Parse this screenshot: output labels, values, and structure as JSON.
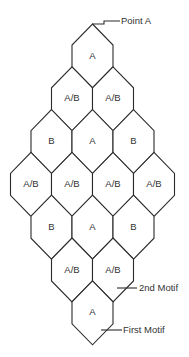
{
  "diagram": {
    "type": "hexagonal-motif-layout",
    "rows": [
      {
        "row": 1,
        "cells": [
          "A"
        ]
      },
      {
        "row": 2,
        "cells": [
          "A/B",
          "A/B"
        ]
      },
      {
        "row": 3,
        "cells": [
          "B",
          "A",
          "B"
        ]
      },
      {
        "row": 4,
        "cells": [
          "A/B",
          "A/B",
          "A/B",
          "A/B"
        ]
      },
      {
        "row": 5,
        "cells": [
          "B",
          "A",
          "B"
        ]
      },
      {
        "row": 6,
        "cells": [
          "A/B",
          "A/B"
        ]
      },
      {
        "row": 7,
        "cells": [
          "A"
        ]
      }
    ],
    "callouts": {
      "point_a": "Point A",
      "second_motif": "2nd Motif",
      "first_motif": "First Motif"
    },
    "colors": {
      "stroke": "#2a2a2a",
      "text": "#333333",
      "background": "#ffffff"
    }
  }
}
